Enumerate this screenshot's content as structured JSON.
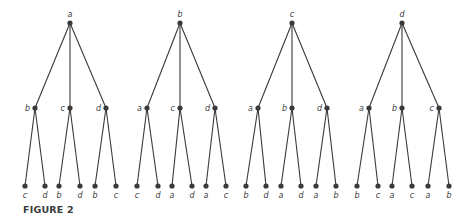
{
  "caption": "FIGURE 2",
  "trees": [
    {
      "root": {
        "label": "a",
        "x": 70
      },
      "children": [
        {
          "label": "b",
          "x": 35,
          "leaves": [
            {
              "label": "c",
              "x": 25
            },
            {
              "label": "d",
              "x": 45
            }
          ]
        },
        {
          "label": "c",
          "x": 70,
          "leaves": [
            {
              "label": "b",
              "x": 59
            },
            {
              "label": "d",
              "x": 80
            }
          ]
        },
        {
          "label": "d",
          "x": 106,
          "leaves": [
            {
              "label": "b",
              "x": 95
            },
            {
              "label": "c",
              "x": 116
            }
          ]
        }
      ]
    },
    {
      "root": {
        "label": "b",
        "x": 180
      },
      "children": [
        {
          "label": "a",
          "x": 147,
          "leaves": [
            {
              "label": "c",
              "x": 137
            },
            {
              "label": "d",
              "x": 158
            }
          ]
        },
        {
          "label": "c",
          "x": 180,
          "leaves": [
            {
              "label": "a",
              "x": 172
            },
            {
              "label": "d",
              "x": 192
            }
          ]
        },
        {
          "label": "d",
          "x": 215,
          "leaves": [
            {
              "label": "a",
              "x": 206
            },
            {
              "label": "c",
              "x": 226
            }
          ]
        }
      ]
    },
    {
      "root": {
        "label": "c",
        "x": 292
      },
      "children": [
        {
          "label": "a",
          "x": 258,
          "leaves": [
            {
              "label": "b",
              "x": 246
            },
            {
              "label": "d",
              "x": 266
            }
          ]
        },
        {
          "label": "b",
          "x": 292,
          "leaves": [
            {
              "label": "a",
              "x": 281
            },
            {
              "label": "d",
              "x": 301
            }
          ]
        },
        {
          "label": "d",
          "x": 327,
          "leaves": [
            {
              "label": "a",
              "x": 316
            },
            {
              "label": "b",
              "x": 336
            }
          ]
        }
      ]
    },
    {
      "root": {
        "label": "d",
        "x": 402
      },
      "children": [
        {
          "label": "a",
          "x": 369,
          "leaves": [
            {
              "label": "b",
              "x": 357
            },
            {
              "label": "c",
              "x": 378
            }
          ]
        },
        {
          "label": "b",
          "x": 402,
          "leaves": [
            {
              "label": "a",
              "x": 392
            },
            {
              "label": "c",
              "x": 412
            }
          ]
        },
        {
          "label": "c",
          "x": 439,
          "leaves": [
            {
              "label": "a",
              "x": 428
            },
            {
              "label": "b",
              "x": 449
            }
          ]
        }
      ]
    }
  ],
  "layout": {
    "root_y": 23,
    "mid_y": 108,
    "leaf_y": 186,
    "color": "#3a3a3a"
  }
}
